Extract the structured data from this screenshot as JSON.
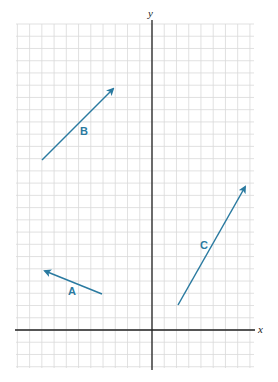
{
  "diagram": {
    "title": "",
    "axes": {
      "x_label": "x",
      "y_label": "y",
      "axis_color": "#222222"
    },
    "grid": {
      "color": "#d9d9d9",
      "spacing_px": 12.24,
      "origin_px": [
        152,
        330
      ]
    },
    "vectors": [
      {
        "label": "A",
        "from_grid": [
          -4,
          3
        ],
        "to_grid": [
          -9,
          5
        ],
        "color": "#2a7aa0"
      },
      {
        "label": "B",
        "from_grid": [
          -9,
          14
        ],
        "to_grid": [
          -3,
          20
        ],
        "color": "#2a7aa0"
      },
      {
        "label": "C",
        "from_grid": [
          2,
          2
        ],
        "to_grid": [
          8,
          12
        ],
        "color": "#2a7aa0"
      }
    ]
  }
}
